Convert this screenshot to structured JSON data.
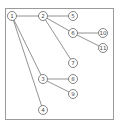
{
  "diagram": {
    "type": "tree",
    "frame": {
      "x": 5,
      "y": 8,
      "width": 108,
      "height": 111
    },
    "nodes": [
      {
        "id": "1",
        "label": "1",
        "x": 12,
        "y": 16
      },
      {
        "id": "2",
        "label": "2",
        "x": 43,
        "y": 16
      },
      {
        "id": "3",
        "label": "3",
        "x": 43,
        "y": 79
      },
      {
        "id": "4",
        "label": "4",
        "x": 43,
        "y": 110
      },
      {
        "id": "5",
        "label": "5",
        "x": 73,
        "y": 16
      },
      {
        "id": "6",
        "label": "6",
        "x": 73,
        "y": 33
      },
      {
        "id": "7",
        "label": "7",
        "x": 73,
        "y": 63
      },
      {
        "id": "8",
        "label": "8",
        "x": 73,
        "y": 79
      },
      {
        "id": "9",
        "label": "9",
        "x": 73,
        "y": 94
      },
      {
        "id": "10",
        "label": "10",
        "x": 103,
        "y": 33
      },
      {
        "id": "11",
        "label": "11",
        "x": 103,
        "y": 48
      }
    ],
    "edges": [
      {
        "from": "1",
        "to": "2"
      },
      {
        "from": "1",
        "to": "3"
      },
      {
        "from": "1",
        "to": "4"
      },
      {
        "from": "2",
        "to": "5"
      },
      {
        "from": "2",
        "to": "6"
      },
      {
        "from": "2",
        "to": "7"
      },
      {
        "from": "6",
        "to": "10"
      },
      {
        "from": "6",
        "to": "11"
      },
      {
        "from": "3",
        "to": "8"
      },
      {
        "from": "3",
        "to": "9"
      }
    ],
    "node_radius": 4.5
  }
}
